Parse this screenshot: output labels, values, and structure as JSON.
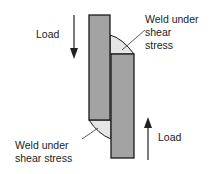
{
  "diagram": {
    "type": "lap-joint-fillet-weld",
    "labels": {
      "load_top": "Load",
      "load_bottom": "Load",
      "weld_top_line1": "Weld under",
      "weld_top_line2": "shear",
      "weld_top_line3": "stress",
      "weld_bottom_line1": "Weld under",
      "weld_bottom_line2": "shear stress"
    },
    "colors": {
      "plate_fill": "#a3a3a3",
      "plate_stroke": "#1a1a1a",
      "weld_fill": "#e6e6e6",
      "arrow": "#222222"
    },
    "arrows": [
      {
        "direction": "down",
        "label": "Load"
      },
      {
        "direction": "up",
        "label": "Load"
      }
    ]
  }
}
